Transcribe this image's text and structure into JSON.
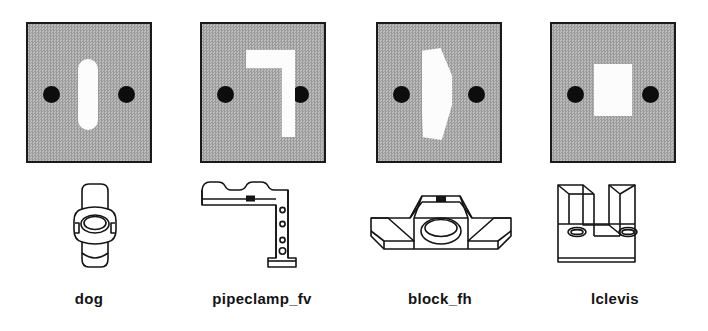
{
  "figure": {
    "type": "part-gallery",
    "background_color": "#ffffff",
    "tile_fill_color": "#a8a8a8",
    "tile_border_color": "#1a1a1a",
    "hole_color": "#0d0d0d",
    "cutout_color": "#fcfcfc",
    "line_color": "#141414",
    "columns": 4,
    "rows": 3,
    "row_descriptions": [
      "grayscale range image tiles",
      "wireframe line drawings",
      "part name labels"
    ]
  },
  "items": [
    {
      "id": "dog",
      "label": "dog",
      "tile": {
        "name": "range-image-dog",
        "holes": 2,
        "cutout_shape": "vertical-rounded-slot"
      },
      "drawing": {
        "name": "wireframe-dog",
        "description": "cylindrical dog clamp with central elliptical bore"
      }
    },
    {
      "id": "pipeclamp_fv",
      "label": "pipeclamp_fv",
      "tile": {
        "name": "range-image-pipeclamp",
        "holes": 2,
        "cutout_shape": "mirrored-L-bracket"
      },
      "drawing": {
        "name": "wireframe-pipeclamp",
        "description": "L shaped pipe clamp bracket with scalloped top edge and bolt holes"
      }
    },
    {
      "id": "block_fh",
      "label": "block_fh",
      "tile": {
        "name": "range-image-block",
        "holes": 2,
        "cutout_shape": "crescent-D"
      },
      "drawing": {
        "name": "wireframe-block",
        "description": "tapered block with central elliptical boss and flared side wings"
      }
    },
    {
      "id": "lclevis",
      "label": "lclevis",
      "tile": {
        "name": "range-image-lclevis",
        "holes": 2,
        "cutout_shape": "rectangle"
      },
      "drawing": {
        "name": "wireframe-lclevis",
        "description": "U shaped clevis block with two upright prongs and two side holes"
      }
    }
  ]
}
